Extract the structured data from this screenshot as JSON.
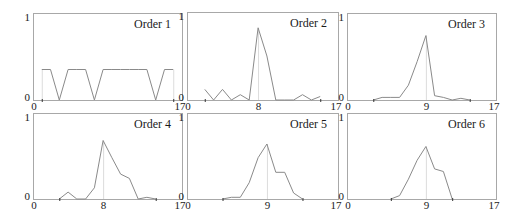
{
  "figure": {
    "colors": {
      "frame": "#a8a8a8",
      "series": "#8a8a8a",
      "marker_line": "#dcdcdc",
      "text": "#1a1a1a"
    }
  },
  "chart_data": [
    {
      "type": "line",
      "title": "Order 1",
      "xlabel": "",
      "ylabel": "",
      "xlim": [
        0,
        17
      ],
      "ylim": [
        0,
        1
      ],
      "x_tick_labels": [
        "0",
        "17"
      ],
      "y_tick_labels": [
        "0",
        "1"
      ],
      "peak_label": null,
      "marker_lines": [
        1,
        16
      ],
      "range": [
        1,
        16
      ],
      "grid": false,
      "points": [
        [
          1,
          0.35
        ],
        [
          2,
          0.35
        ],
        [
          3,
          0
        ],
        [
          4,
          0.35
        ],
        [
          5,
          0.35
        ],
        [
          6,
          0.35
        ],
        [
          7,
          0
        ],
        [
          8,
          0.35
        ],
        [
          9,
          0.35
        ],
        [
          10,
          0.35
        ],
        [
          11,
          0.35
        ],
        [
          12,
          0.35
        ],
        [
          13,
          0.35
        ],
        [
          14,
          0
        ],
        [
          15,
          0.35
        ],
        [
          16,
          0.35
        ]
      ]
    },
    {
      "type": "line",
      "title": "Order 2",
      "xlabel": "",
      "ylabel": "",
      "xlim": [
        0,
        17
      ],
      "ylim": [
        0,
        1
      ],
      "x_tick_labels": [
        "0",
        "17"
      ],
      "y_tick_labels": [
        "0",
        "1"
      ],
      "peak_label": "8",
      "peak_x": 8,
      "marker_lines": [
        8
      ],
      "range": [
        2,
        15
      ],
      "grid": false,
      "points": [
        [
          2,
          0.12
        ],
        [
          3,
          0
        ],
        [
          4,
          0.12
        ],
        [
          5,
          0
        ],
        [
          6,
          0.06
        ],
        [
          7,
          0
        ],
        [
          8,
          0.82
        ],
        [
          9,
          0.5
        ],
        [
          10,
          0
        ],
        [
          11,
          0
        ],
        [
          12,
          0
        ],
        [
          13,
          0.06
        ],
        [
          14,
          0
        ],
        [
          15,
          0.04
        ]
      ]
    },
    {
      "type": "line",
      "title": "Order 3",
      "xlabel": "",
      "ylabel": "",
      "xlim": [
        0,
        17
      ],
      "ylim": [
        0,
        1
      ],
      "x_tick_labels": [
        "0",
        "17"
      ],
      "y_tick_labels": [
        "0",
        "1"
      ],
      "peak_label": "9",
      "peak_x": 9,
      "marker_lines": [
        9
      ],
      "range": [
        3,
        14
      ],
      "grid": false,
      "points": [
        [
          3,
          0
        ],
        [
          4,
          0.03
        ],
        [
          5,
          0.03
        ],
        [
          6,
          0.03
        ],
        [
          7,
          0.17
        ],
        [
          8,
          0.44
        ],
        [
          9,
          0.74
        ],
        [
          10,
          0.05
        ],
        [
          11,
          0.03
        ],
        [
          12,
          0
        ],
        [
          13,
          0.02
        ],
        [
          14,
          0
        ]
      ]
    },
    {
      "type": "line",
      "title": "Order 4",
      "xlabel": "",
      "ylabel": "",
      "xlim": [
        0,
        17
      ],
      "ylim": [
        0,
        1
      ],
      "x_tick_labels": [
        "0",
        "17"
      ],
      "y_tick_labels": [
        "0",
        "1"
      ],
      "peak_label": "8",
      "peak_x": 8,
      "marker_lines": [
        8
      ],
      "range": [
        3,
        14
      ],
      "grid": false,
      "points": [
        [
          3,
          0
        ],
        [
          4,
          0.08
        ],
        [
          5,
          0
        ],
        [
          6,
          0
        ],
        [
          7,
          0.13
        ],
        [
          8,
          0.68
        ],
        [
          9,
          0.48
        ],
        [
          10,
          0.29
        ],
        [
          11,
          0.24
        ],
        [
          12,
          0
        ],
        [
          13,
          0.02
        ],
        [
          14,
          0
        ]
      ]
    },
    {
      "type": "line",
      "title": "Order 5",
      "xlabel": "",
      "ylabel": "",
      "xlim": [
        0,
        17
      ],
      "ylim": [
        0,
        1
      ],
      "x_tick_labels": [
        "0",
        "17"
      ],
      "y_tick_labels": [
        "0",
        "1"
      ],
      "peak_label": "9",
      "peak_x": 9,
      "marker_lines": [
        9
      ],
      "range": [
        4,
        13
      ],
      "grid": false,
      "points": [
        [
          4,
          0
        ],
        [
          5,
          0.02
        ],
        [
          6,
          0.02
        ],
        [
          7,
          0.19
        ],
        [
          8,
          0.48
        ],
        [
          9,
          0.64
        ],
        [
          10,
          0.31
        ],
        [
          11,
          0.31
        ],
        [
          12,
          0.07
        ],
        [
          13,
          0
        ]
      ]
    },
    {
      "type": "line",
      "title": "Order 6",
      "xlabel": "",
      "ylabel": "",
      "xlim": [
        0,
        17
      ],
      "ylim": [
        0,
        1
      ],
      "x_tick_labels": [
        "0",
        "17"
      ],
      "y_tick_labels": [
        "0",
        "1"
      ],
      "peak_label": "9",
      "peak_x": 9,
      "marker_lines": [
        9
      ],
      "range": [
        5,
        12
      ],
      "grid": false,
      "points": [
        [
          5,
          0
        ],
        [
          6,
          0.04
        ],
        [
          7,
          0.23
        ],
        [
          8,
          0.45
        ],
        [
          9,
          0.61
        ],
        [
          10,
          0.35
        ],
        [
          11,
          0.32
        ],
        [
          12,
          0
        ]
      ]
    }
  ]
}
